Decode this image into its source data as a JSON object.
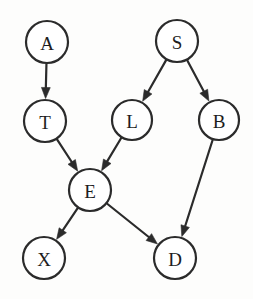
{
  "diagram": {
    "type": "directed-acyclic-graph",
    "canvas": {
      "width": 253,
      "height": 299,
      "background": "#fdfdfc"
    },
    "style": {
      "stroke": "#2b2b2b",
      "fill": "#ffffff",
      "stroke_width": 2.2,
      "label_size": 19
    },
    "nodes": [
      {
        "id": "A",
        "label": "A",
        "cx": 47,
        "cy": 42,
        "r": 21
      },
      {
        "id": "S",
        "label": "S",
        "cx": 177,
        "cy": 41,
        "r": 21
      },
      {
        "id": "T",
        "label": "T",
        "cx": 45,
        "cy": 121,
        "r": 21
      },
      {
        "id": "L",
        "label": "L",
        "cx": 132,
        "cy": 120,
        "r": 20
      },
      {
        "id": "B",
        "label": "B",
        "cx": 219,
        "cy": 120,
        "r": 20
      },
      {
        "id": "E",
        "label": "E",
        "cx": 90,
        "cy": 190,
        "r": 21
      },
      {
        "id": "X",
        "label": "X",
        "cx": 44,
        "cy": 258,
        "r": 21
      },
      {
        "id": "D",
        "label": "D",
        "cx": 175,
        "cy": 258,
        "r": 21
      }
    ],
    "edges": [
      {
        "id": "A-T",
        "from": "A",
        "to": "T",
        "directed": true
      },
      {
        "id": "S-L",
        "from": "S",
        "to": "L",
        "directed": true
      },
      {
        "id": "S-B",
        "from": "S",
        "to": "B",
        "directed": true
      },
      {
        "id": "T-E",
        "from": "T",
        "to": "E",
        "directed": true
      },
      {
        "id": "L-E",
        "from": "L",
        "to": "E",
        "directed": true
      },
      {
        "id": "B-D",
        "from": "B",
        "to": "D",
        "directed": true
      },
      {
        "id": "E-X",
        "from": "E",
        "to": "X",
        "directed": true
      },
      {
        "id": "E-D",
        "from": "E",
        "to": "D",
        "directed": true
      }
    ]
  }
}
